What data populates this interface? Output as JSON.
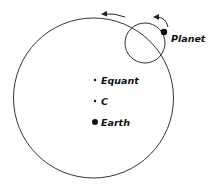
{
  "diagram": {
    "colors": {
      "stroke": "#333333",
      "dot": "#111111",
      "background": "#ffffff"
    },
    "deferent": {
      "cx": 93.5,
      "cy": 98,
      "r": 80
    },
    "epicycle": {
      "cx": 145,
      "cy": 43,
      "r": 20
    },
    "labels": {
      "planet": "Planet",
      "equant": "Equant",
      "center": "C",
      "earth": "Earth"
    },
    "points": {
      "planet": {
        "x": 164,
        "y": 32,
        "r": 3.2
      },
      "equant": {
        "x": 95,
        "y": 80,
        "r": 1.2
      },
      "center": {
        "x": 95,
        "y": 101,
        "r": 1.2
      },
      "earth": {
        "x": 95,
        "y": 122,
        "r": 3
      }
    },
    "arrows": [
      {
        "name": "deferent-motion-arrow",
        "direction": "counterclockwise"
      },
      {
        "name": "epicycle-motion-arrow",
        "direction": "counterclockwise"
      }
    ]
  }
}
